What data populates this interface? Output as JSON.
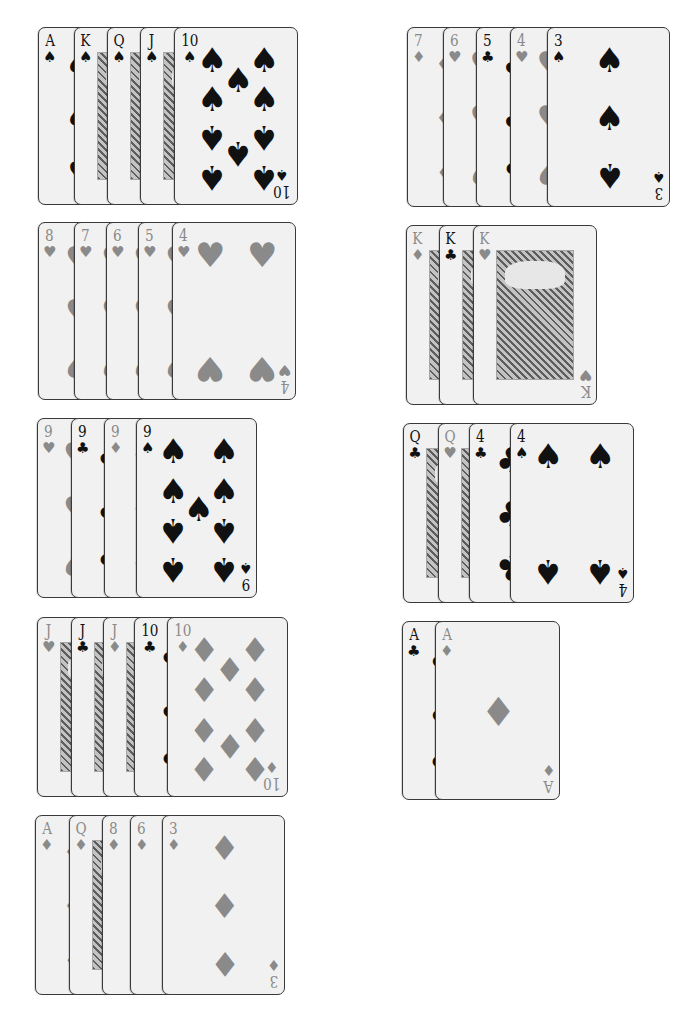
{
  "colors": {
    "black_suit": "#111111",
    "red_suit": "#8a8a8a",
    "card_bg": "#f1f1f1",
    "border": "#3a3a3a"
  },
  "hands": [
    {
      "id": "left-1",
      "x": 38,
      "y": 27,
      "height": 178,
      "last_width": 124,
      "offsets": [
        0,
        36,
        69,
        102,
        136
      ],
      "cards": [
        {
          "rank": "A",
          "suit": "spades",
          "symbol": "♠",
          "color": "black"
        },
        {
          "rank": "K",
          "suit": "spades",
          "symbol": "♠",
          "color": "black",
          "face": true
        },
        {
          "rank": "Q",
          "suit": "spades",
          "symbol": "♠",
          "color": "black",
          "face": true
        },
        {
          "rank": "J",
          "suit": "spades",
          "symbol": "♠",
          "color": "black",
          "face": true
        },
        {
          "rank": "10",
          "suit": "spades",
          "symbol": "♠",
          "color": "black",
          "pips": 10
        }
      ]
    },
    {
      "id": "left-2",
      "x": 38,
      "y": 222,
      "height": 178,
      "last_width": 124,
      "offsets": [
        0,
        36,
        68,
        100,
        134
      ],
      "cards": [
        {
          "rank": "8",
          "suit": "hearts",
          "symbol": "♥",
          "color": "red"
        },
        {
          "rank": "7",
          "suit": "hearts",
          "symbol": "♥",
          "color": "red"
        },
        {
          "rank": "6",
          "suit": "hearts",
          "symbol": "♥",
          "color": "red"
        },
        {
          "rank": "5",
          "suit": "hearts",
          "symbol": "♥",
          "color": "red"
        },
        {
          "rank": "4",
          "suit": "hearts",
          "symbol": "♥",
          "color": "red",
          "pips": 4
        }
      ]
    },
    {
      "id": "left-3",
      "x": 37,
      "y": 418,
      "height": 180,
      "last_width": 121,
      "offsets": [
        0,
        34,
        67,
        99
      ],
      "cards": [
        {
          "rank": "9",
          "suit": "hearts",
          "symbol": "♥",
          "color": "red"
        },
        {
          "rank": "9",
          "suit": "clubs",
          "symbol": "♣",
          "color": "black"
        },
        {
          "rank": "9",
          "suit": "diamonds",
          "symbol": "♦",
          "color": "red"
        },
        {
          "rank": "9",
          "suit": "spades",
          "symbol": "♠",
          "color": "black",
          "pips": 9
        }
      ]
    },
    {
      "id": "left-4",
      "x": 37,
      "y": 617,
      "height": 180,
      "last_width": 121,
      "offsets": [
        0,
        34,
        66,
        97,
        130
      ],
      "cards": [
        {
          "rank": "J",
          "suit": "hearts",
          "symbol": "♥",
          "color": "red",
          "face": true
        },
        {
          "rank": "J",
          "suit": "clubs",
          "symbol": "♣",
          "color": "black",
          "face": true
        },
        {
          "rank": "J",
          "suit": "diamonds",
          "symbol": "♦",
          "color": "red",
          "face": true
        },
        {
          "rank": "10",
          "suit": "clubs",
          "symbol": "♣",
          "color": "black"
        },
        {
          "rank": "10",
          "suit": "diamonds",
          "symbol": "♦",
          "color": "red",
          "pips": 10
        }
      ]
    },
    {
      "id": "left-5",
      "x": 35,
      "y": 815,
      "height": 180,
      "last_width": 123,
      "offsets": [
        0,
        34,
        67,
        95,
        127
      ],
      "cards": [
        {
          "rank": "A",
          "suit": "diamonds",
          "symbol": "♦",
          "color": "red"
        },
        {
          "rank": "Q",
          "suit": "diamonds",
          "symbol": "♦",
          "color": "red",
          "face": true
        },
        {
          "rank": "8",
          "suit": "diamonds",
          "symbol": "♦",
          "color": "red"
        },
        {
          "rank": "6",
          "suit": "diamonds",
          "symbol": "♦",
          "color": "red"
        },
        {
          "rank": "3",
          "suit": "diamonds",
          "symbol": "♦",
          "color": "red",
          "pips": 3
        }
      ]
    },
    {
      "id": "right-1",
      "x": 407,
      "y": 27,
      "height": 180,
      "last_width": 123,
      "offsets": [
        0,
        36,
        69,
        103,
        140
      ],
      "cards": [
        {
          "rank": "7",
          "suit": "diamonds",
          "symbol": "♦",
          "color": "red"
        },
        {
          "rank": "6",
          "suit": "hearts",
          "symbol": "♥",
          "color": "red"
        },
        {
          "rank": "5",
          "suit": "clubs",
          "symbol": "♣",
          "color": "black"
        },
        {
          "rank": "4",
          "suit": "hearts",
          "symbol": "♥",
          "color": "red"
        },
        {
          "rank": "3",
          "suit": "spades",
          "symbol": "♠",
          "color": "black",
          "pips": 3
        }
      ]
    },
    {
      "id": "right-2",
      "x": 406,
      "y": 225,
      "height": 180,
      "last_width": 124,
      "offsets": [
        0,
        33,
        67
      ],
      "cards": [
        {
          "rank": "K",
          "suit": "diamonds",
          "symbol": "♦",
          "color": "red",
          "face": true
        },
        {
          "rank": "K",
          "suit": "clubs",
          "symbol": "♣",
          "color": "black",
          "face": true
        },
        {
          "rank": "K",
          "suit": "hearts",
          "symbol": "♥",
          "color": "red",
          "face": true
        }
      ]
    },
    {
      "id": "right-3",
      "x": 403,
      "y": 423,
      "height": 180,
      "last_width": 124,
      "offsets": [
        0,
        35,
        66,
        107
      ],
      "cards": [
        {
          "rank": "Q",
          "suit": "clubs",
          "symbol": "♣",
          "color": "black",
          "face": true
        },
        {
          "rank": "Q",
          "suit": "hearts",
          "symbol": "♥",
          "color": "red",
          "face": true
        },
        {
          "rank": "4",
          "suit": "clubs",
          "symbol": "♣",
          "color": "black"
        },
        {
          "rank": "4",
          "suit": "spades",
          "symbol": "♠",
          "color": "black",
          "pips": 4
        }
      ]
    },
    {
      "id": "right-4",
      "x": 402,
      "y": 621,
      "height": 179,
      "last_width": 125,
      "offsets": [
        0,
        33
      ],
      "cards": [
        {
          "rank": "A",
          "suit": "clubs",
          "symbol": "♣",
          "color": "black"
        },
        {
          "rank": "A",
          "suit": "diamonds",
          "symbol": "♦",
          "color": "red",
          "pips": 1
        }
      ]
    }
  ]
}
